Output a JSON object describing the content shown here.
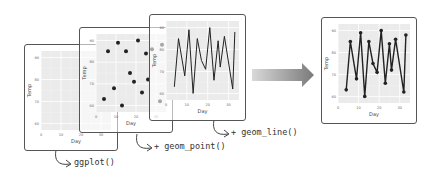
{
  "layers": [
    {
      "id": "base",
      "code": "ggplot()",
      "shows": "empty plot canvas with axes"
    },
    {
      "id": "points",
      "code": "+ geom_point()",
      "shows": "scatter points added"
    },
    {
      "id": "line",
      "code": "+ geom_line()",
      "shows": "line connecting points added"
    }
  ],
  "result_label": "final plot (points + line)",
  "colors": {
    "panel_bg": "#ebebeb",
    "grid": "#ffffff",
    "mark": "#222222",
    "arrow_start": "#d9d9d9",
    "arrow_end": "#7a7a7a"
  },
  "chart_data": {
    "type": "line",
    "title": "",
    "xlabel": "Day",
    "ylabel": "Temp",
    "xlim": [
      0,
      35
    ],
    "ylim": [
      57,
      93
    ],
    "x_ticks": [
      "0",
      "10",
      "20",
      "30"
    ],
    "y_ticks": [
      "60",
      "70",
      "80",
      "90"
    ],
    "grid": true,
    "legend": "none",
    "x": [
      4,
      6,
      9,
      11,
      13,
      15,
      17,
      19,
      21,
      23,
      25,
      26,
      28,
      32,
      33
    ],
    "series": [
      {
        "name": "Temp",
        "values": [
          63,
          85,
          68,
          89,
          60,
          85,
          75,
          71,
          90,
          66,
          84,
          72,
          86,
          62,
          88
        ]
      }
    ]
  }
}
